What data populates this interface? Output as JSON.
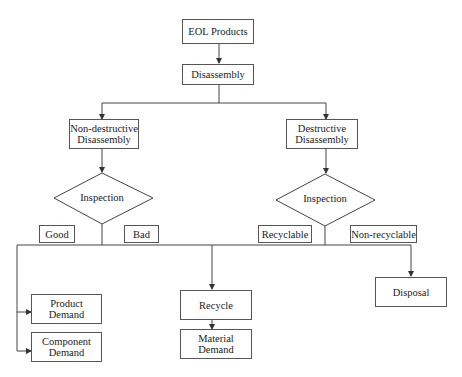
{
  "nodes": {
    "eol": "EOL Products",
    "disassembly": "Disassembly",
    "non_destructive": "Non-destructive Disassembly",
    "destructive": "Destructive Disassembly",
    "inspection_left": "Inspection",
    "inspection_right": "Inspection",
    "good": "Good",
    "bad": "Bad",
    "recyclable": "Recyclable",
    "non_recyclable": "Non-recyclable",
    "product_demand": "Product Demand",
    "component_demand": "Component Demand",
    "recycle": "Recycle",
    "material_demand": "Material Demand",
    "disposal": "Disposal"
  }
}
